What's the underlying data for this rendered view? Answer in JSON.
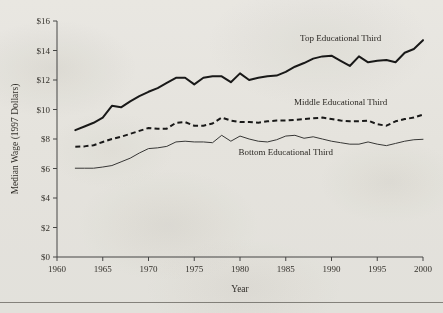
{
  "figure": {
    "y_axis_title": "Median Wage (1997 Dollars)",
    "x_axis_title": "Year"
  },
  "chart_data": {
    "type": "line",
    "title": "",
    "xlabel": "Year",
    "ylabel": "Median Wage (1997 Dollars)",
    "xlim": [
      1960,
      2000
    ],
    "ylim": [
      0,
      16
    ],
    "xticks": [
      1960,
      1965,
      1970,
      1975,
      1980,
      1985,
      1990,
      1995,
      2000
    ],
    "xtick_labels": [
      "1960",
      "1965",
      "1970",
      "1975",
      "1980",
      "1985",
      "1990",
      "1995",
      "2000"
    ],
    "yticks": [
      0,
      2,
      4,
      6,
      8,
      10,
      12,
      14,
      16
    ],
    "ytick_labels": [
      "$0",
      "$2",
      "$4",
      "$6",
      "$8",
      "$10",
      "$12",
      "$14",
      "$16"
    ],
    "grid": false,
    "legend_position": "inline-annotations",
    "x": [
      1962,
      1963,
      1964,
      1965,
      1966,
      1967,
      1968,
      1969,
      1970,
      1971,
      1972,
      1973,
      1974,
      1975,
      1976,
      1977,
      1978,
      1979,
      1980,
      1981,
      1982,
      1983,
      1984,
      1985,
      1986,
      1987,
      1988,
      1989,
      1990,
      1991,
      1992,
      1993,
      1994,
      1995,
      1996,
      1997,
      1998,
      1999,
      2000
    ],
    "series": [
      {
        "name": "Top Educational Third",
        "style": "solid-thick",
        "color": "#1a1a1a",
        "label": "Top Educational Third",
        "values": [
          8.6,
          8.85,
          9.1,
          9.45,
          10.25,
          10.15,
          10.55,
          10.9,
          11.2,
          11.45,
          11.8,
          12.15,
          12.15,
          11.7,
          12.15,
          12.25,
          12.25,
          11.85,
          12.45,
          12.0,
          12.15,
          12.25,
          12.3,
          12.55,
          12.9,
          13.15,
          13.45,
          13.6,
          13.65,
          13.3,
          12.95,
          13.6,
          13.2,
          13.3,
          13.35,
          13.2,
          13.85,
          14.1,
          14.7
        ]
      },
      {
        "name": "Middle Educational Third",
        "style": "dashed",
        "color": "#1a1a1a",
        "label": "Middle Educational Third",
        "values": [
          7.48,
          7.5,
          7.58,
          7.8,
          8.0,
          8.15,
          8.35,
          8.55,
          8.75,
          8.7,
          8.7,
          9.1,
          9.15,
          8.9,
          8.9,
          9.05,
          9.45,
          9.25,
          9.15,
          9.15,
          9.1,
          9.2,
          9.25,
          9.25,
          9.3,
          9.35,
          9.4,
          9.45,
          9.35,
          9.25,
          9.2,
          9.2,
          9.25,
          9.0,
          8.9,
          9.2,
          9.35,
          9.45,
          9.65
        ]
      },
      {
        "name": "Bottom Educational Third",
        "style": "solid-thin",
        "color": "#3a3a3a",
        "label": "Bottom Educational Third",
        "values": [
          6.02,
          6.02,
          6.02,
          6.1,
          6.2,
          6.45,
          6.7,
          7.05,
          7.35,
          7.4,
          7.5,
          7.8,
          7.85,
          7.8,
          7.8,
          7.75,
          8.25,
          7.85,
          8.2,
          8.0,
          7.85,
          7.8,
          7.95,
          8.2,
          8.25,
          8.05,
          8.15,
          8.0,
          7.85,
          7.75,
          7.65,
          7.65,
          7.8,
          7.65,
          7.55,
          7.7,
          7.85,
          7.95,
          7.98
        ]
      }
    ]
  }
}
